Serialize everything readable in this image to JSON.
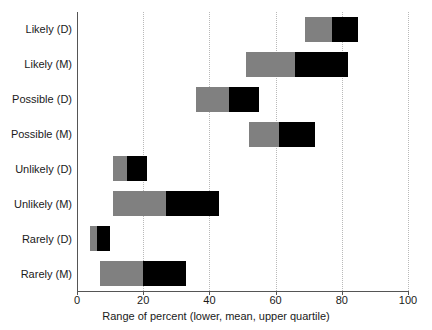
{
  "chart_data": {
    "type": "bar",
    "subtype": "horizontal-range-bar",
    "title": "",
    "xlabel": "Range of percent (lower, mean, upper quartile)",
    "ylabel": "",
    "xlim": [
      0,
      100
    ],
    "xticks": [
      0,
      20,
      40,
      60,
      80,
      100
    ],
    "xticklabels": [
      "0",
      "20",
      "40",
      "60",
      "80",
      "100"
    ],
    "grid": "vertical-dotted",
    "legend": "none",
    "colors": {
      "lower_to_mean": "#808080",
      "mean_to_upper": "#000000",
      "gridline": "#b9b9b9",
      "axis": "#555555",
      "text": "#1a1a1a",
      "background": "#ffffff"
    },
    "categories": [
      "Likely (D)",
      "Likely (M)",
      "Possible (D)",
      "Possible (M)",
      "Unlikely (D)",
      "Unlikely (M)",
      "Rarely (D)",
      "Rarely (M)"
    ],
    "series": [
      {
        "name": "lower quartile",
        "values": [
          69,
          51,
          36,
          52,
          11,
          11,
          4,
          7
        ]
      },
      {
        "name": "mean",
        "values": [
          77,
          66,
          46,
          61,
          15,
          27,
          6,
          20
        ]
      },
      {
        "name": "upper quartile",
        "values": [
          85,
          82,
          55,
          72,
          21,
          43,
          10,
          33
        ]
      }
    ],
    "bars": [
      {
        "category": "Likely (D)",
        "lower": 69,
        "mean": 77,
        "upper": 85
      },
      {
        "category": "Likely (M)",
        "lower": 51,
        "mean": 66,
        "upper": 82
      },
      {
        "category": "Possible (D)",
        "lower": 36,
        "mean": 46,
        "upper": 55
      },
      {
        "category": "Possible (M)",
        "lower": 52,
        "mean": 61,
        "upper": 72
      },
      {
        "category": "Unlikely (D)",
        "lower": 11,
        "mean": 15,
        "upper": 21
      },
      {
        "category": "Unlikely (M)",
        "lower": 11,
        "mean": 27,
        "upper": 43
      },
      {
        "category": "Rarely (D)",
        "lower": 4,
        "mean": 6,
        "upper": 10
      },
      {
        "category": "Rarely (M)",
        "lower": 7,
        "mean": 20,
        "upper": 33
      }
    ]
  }
}
